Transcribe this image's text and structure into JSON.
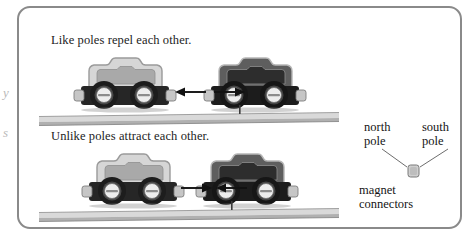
{
  "figure": {
    "kind": "physics-illustration",
    "border_color": "#8a8a8a",
    "background_color": "#ffffff"
  },
  "panels": [
    {
      "id": "repel",
      "caption": "Like poles repel each other.",
      "force_direction": "outward",
      "cars": [
        {
          "id": "light-car-top",
          "shade": "light",
          "facing": "right"
        },
        {
          "id": "dark-car-top",
          "shade": "dark",
          "facing": "left"
        }
      ]
    },
    {
      "id": "attract",
      "caption": "Unlike poles attract each other.",
      "force_direction": "inward",
      "cars": [
        {
          "id": "light-car-bottom",
          "shade": "light",
          "facing": "right"
        },
        {
          "id": "dark-car-bottom",
          "shade": "dark",
          "facing": "left"
        }
      ]
    }
  ],
  "legend": {
    "north_line1": "north",
    "north_line2": "pole",
    "south_line1": "south",
    "south_line2": "pole",
    "connectors_line1": "magnet",
    "connectors_line2": "connectors"
  },
  "edge_fragments": [
    {
      "glyph": "y",
      "top": 88
    },
    {
      "glyph": "s",
      "top": 128
    }
  ],
  "colors": {
    "frame": "#8a8a8a",
    "text": "#1a1a1a",
    "car_light_body": "#d4d4d4",
    "car_light_panel": "#a8a8a8",
    "car_dark_body": "#5d5d5d",
    "car_dark_panel": "#2f2f2f",
    "chassis": "#262626",
    "wheel_tire": "#1e1e1e",
    "wheel_hub": "#e8e8e8",
    "rail_top": "#d8d8d8",
    "rail_body": "#bfbfbf",
    "connector_nub": "#c9c9c9",
    "arrow": "#111111",
    "edge_fragment": "#b9b9b9"
  }
}
